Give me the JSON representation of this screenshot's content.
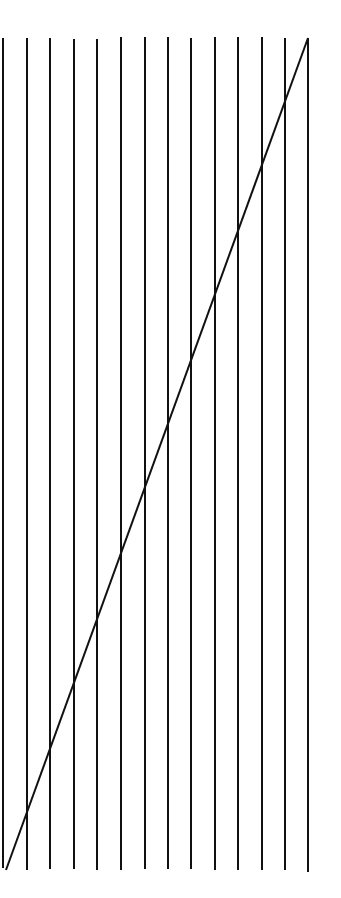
{
  "diagram": {
    "title": "",
    "background": "#ffffff",
    "stroke_color": "#111111",
    "vertical_lines": [
      {
        "x": 3,
        "y1": 38,
        "y2": 868
      },
      {
        "x": 27,
        "y1": 38,
        "y2": 870
      },
      {
        "x": 50,
        "y1": 38,
        "y2": 869
      },
      {
        "x": 74,
        "y1": 39,
        "y2": 869
      },
      {
        "x": 97,
        "y1": 39,
        "y2": 870
      },
      {
        "x": 121,
        "y1": 37,
        "y2": 870
      },
      {
        "x": 145,
        "y1": 37,
        "y2": 869
      },
      {
        "x": 168,
        "y1": 37,
        "y2": 869
      },
      {
        "x": 191,
        "y1": 38,
        "y2": 869
      },
      {
        "x": 215,
        "y1": 37,
        "y2": 870
      },
      {
        "x": 238,
        "y1": 37,
        "y2": 870
      },
      {
        "x": 262,
        "y1": 37,
        "y2": 870
      },
      {
        "x": 285,
        "y1": 38,
        "y2": 870
      },
      {
        "x": 308,
        "y1": 38,
        "y2": 872
      }
    ],
    "diagonal_line": {
      "x1": 308,
      "y1": 38,
      "x2": 6,
      "y2": 870
    },
    "stroke_width": 2
  }
}
